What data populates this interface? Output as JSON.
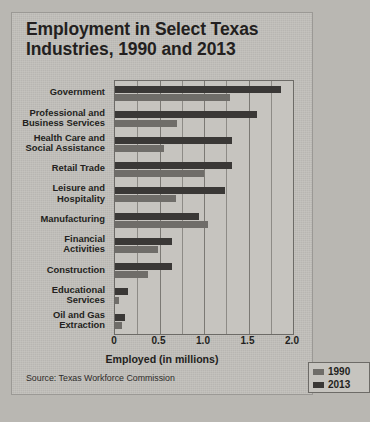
{
  "figure": {
    "title": "Employment in Select Texas Industries, 1990 and 2013",
    "source": "Source: Texas Workforce Commission"
  },
  "legend": {
    "items": [
      {
        "label": "1990",
        "color": "#6f6d69"
      },
      {
        "label": "2013",
        "color": "#3a3836"
      }
    ]
  },
  "chart_data": {
    "type": "bar",
    "orientation": "horizontal",
    "title": "Employment in Select Texas Industries, 1990 and 2013",
    "xlabel": "Employed (in millions)",
    "ylabel": "",
    "xlim": [
      0,
      2.0
    ],
    "xticks": [
      "0",
      "0.5",
      "1.0",
      "1.5",
      "2.0"
    ],
    "xtick_values": [
      0,
      0.5,
      1.0,
      1.5,
      2.0
    ],
    "grid": "vertical minor gridlines every 0.25",
    "legend_position": "bottom-right inside axes",
    "source": "Source: Texas Workforce Commission",
    "categories": [
      "Government",
      "Professional and Business Services",
      "Health Care and Social Assistance",
      "Retail Trade",
      "Leisure and Hospitality",
      "Manufacturing",
      "Financial Activities",
      "Construction",
      "Educational Services",
      "Oil and Gas Extraction"
    ],
    "category_label_lines": [
      [
        "Government"
      ],
      [
        "Professional and",
        "Business Services"
      ],
      [
        "Health Care and",
        "Social Assistance"
      ],
      [
        "Retail Trade"
      ],
      [
        "Leisure and",
        "Hospitality"
      ],
      [
        "Manufacturing"
      ],
      [
        "Financial",
        "Activities"
      ],
      [
        "Construction"
      ],
      [
        "Educational",
        "Services"
      ],
      [
        "Oil and Gas",
        "Extraction"
      ]
    ],
    "series": [
      {
        "name": "1990",
        "color": "#6f6d69",
        "values": [
          1.29,
          0.7,
          0.55,
          1.0,
          0.69,
          1.05,
          0.48,
          0.37,
          0.04,
          0.08
        ]
      },
      {
        "name": "2013",
        "color": "#3a3836",
        "values": [
          1.86,
          1.6,
          1.32,
          1.32,
          1.24,
          0.94,
          0.64,
          0.64,
          0.15,
          0.11
        ]
      }
    ]
  }
}
